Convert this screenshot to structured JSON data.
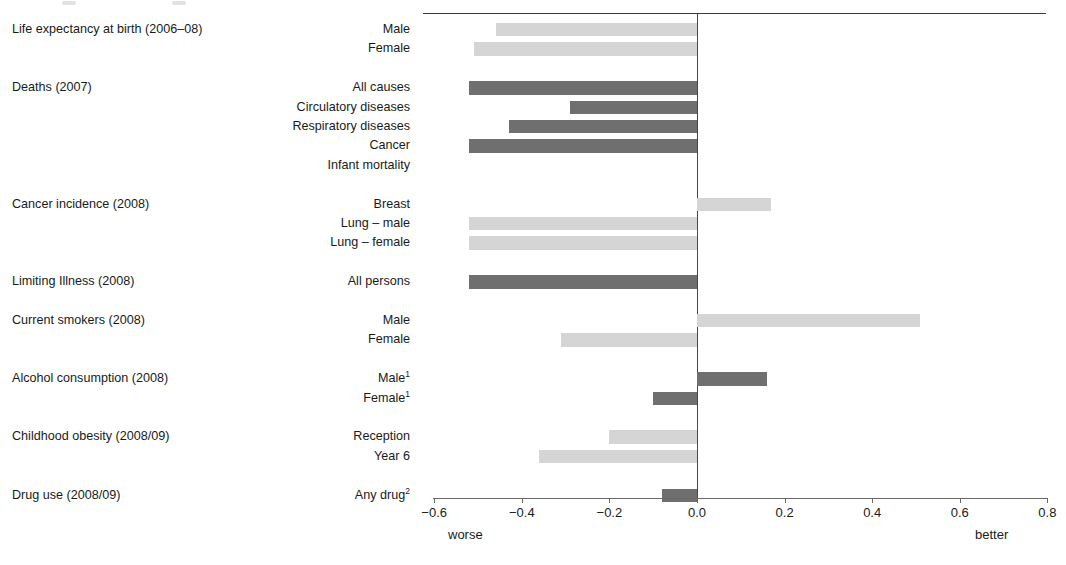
{
  "chart_data": {
    "type": "bar",
    "orientation": "horizontal",
    "title": "",
    "xlabel": "",
    "ylabel": "",
    "xlim": [
      -0.6,
      0.8
    ],
    "grid": false,
    "legend": null,
    "axis": {
      "ticks": [
        -0.6,
        -0.4,
        -0.2,
        0.0,
        0.2,
        0.4,
        0.6,
        0.8
      ],
      "tick_labels": [
        "−0.6",
        "−0.4",
        "−0.2",
        "0.0",
        "0.2",
        "0.4",
        "0.6",
        "0.8"
      ],
      "left_end_label": "worse",
      "right_end_label": "better",
      "zero_reference": 0.0
    },
    "colors": {
      "light_bar": "#d5d5d5",
      "dark_bar": "#6f6f6f",
      "axis": "#6a6a6a",
      "zero_line": "#4a4a4a",
      "text": "#1a1a1a"
    },
    "groups": [
      {
        "label": "Life expectancy at birth (2006–08)",
        "items": [
          {
            "label": "Male",
            "value": -0.46,
            "shade": "light"
          },
          {
            "label": "Female",
            "value": -0.51,
            "shade": "light"
          }
        ]
      },
      {
        "label": "Deaths (2007)",
        "items": [
          {
            "label": "All causes",
            "value": -0.52,
            "shade": "dark"
          },
          {
            "label": "Circulatory diseases",
            "value": -0.29,
            "shade": "dark"
          },
          {
            "label": "Respiratory diseases",
            "value": -0.43,
            "shade": "dark"
          },
          {
            "label": "Cancer",
            "value": -0.52,
            "shade": "dark"
          },
          {
            "label": "Infant mortality",
            "value": 0.0,
            "shade": "dark"
          }
        ]
      },
      {
        "label": "Cancer incidence (2008)",
        "items": [
          {
            "label": "Breast",
            "value": 0.17,
            "shade": "light"
          },
          {
            "label": "Lung – male",
            "value": -0.52,
            "shade": "light"
          },
          {
            "label": "Lung – female",
            "value": -0.52,
            "shade": "light"
          }
        ]
      },
      {
        "label": "Limiting Illness (2008)",
        "items": [
          {
            "label": "All persons",
            "value": -0.52,
            "shade": "dark"
          }
        ]
      },
      {
        "label": "Current smokers (2008)",
        "items": [
          {
            "label": "Male",
            "value": 0.51,
            "shade": "light"
          },
          {
            "label": "Female",
            "value": -0.31,
            "shade": "light"
          }
        ]
      },
      {
        "label": "Alcohol consumption (2008)",
        "items": [
          {
            "label": "Male",
            "value": 0.16,
            "shade": "dark",
            "footnote": "1"
          },
          {
            "label": "Female",
            "value": -0.1,
            "shade": "dark",
            "footnote": "1"
          }
        ]
      },
      {
        "label": "Childhood obesity (2008/09)",
        "items": [
          {
            "label": "Reception",
            "value": -0.2,
            "shade": "light"
          },
          {
            "label": "Year 6",
            "value": -0.36,
            "shade": "light"
          }
        ]
      },
      {
        "label": "Drug use (2008/09)",
        "items": [
          {
            "label": "Any drug",
            "value": -0.08,
            "shade": "dark",
            "footnote": "2"
          }
        ]
      }
    ]
  }
}
